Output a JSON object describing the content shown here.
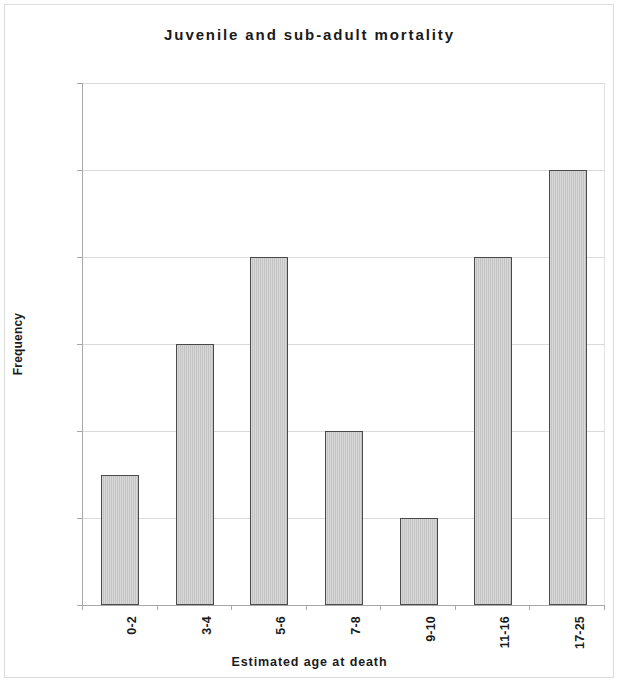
{
  "chart_data": {
    "type": "bar",
    "title": "Juvenile and sub-adult mortality",
    "xlabel": "Estimated age at death",
    "ylabel": "Frequency",
    "categories": [
      "0-2",
      "3-4",
      "5-6",
      "7-8",
      "9-10",
      "11-16",
      "17-25"
    ],
    "values": [
      3,
      6,
      8,
      4,
      2,
      8,
      10
    ],
    "ylim": [
      0,
      12
    ],
    "ytick_labels": [
      "0",
      "2",
      "4",
      "6",
      "8",
      "10",
      "12"
    ],
    "ytick_values": [
      0,
      2,
      4,
      6,
      8,
      10,
      12
    ],
    "grid": "horizontal",
    "legend": "none",
    "bar_fill_color": "#c4c4c4",
    "bar_border_color": "#4a4a4a",
    "gridline_color": "#d9d9d9",
    "axis_color": "#a8a8a8",
    "background_color": "#ffffff",
    "text_color": "#1a1a1a"
  }
}
